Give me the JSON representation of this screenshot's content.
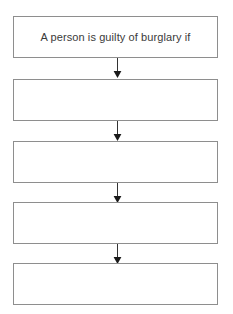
{
  "diagram": {
    "orientation": "vertical-top-down",
    "background_color": "#ffffff",
    "box_border_color": "#8e8e8e",
    "box_fill_color": "#ffffff",
    "text_color": "#3a3a3a",
    "arrow_color": "#333333",
    "nodes": [
      {
        "id": "node-1",
        "label": "A person is guilty of burglary if"
      },
      {
        "id": "node-2",
        "label": ""
      },
      {
        "id": "node-3",
        "label": ""
      },
      {
        "id": "node-4",
        "label": ""
      },
      {
        "id": "node-5",
        "label": ""
      }
    ],
    "connectors": [
      {
        "id": "connector-1",
        "from": "node-1",
        "to": "node-2",
        "kind": "arrow-down"
      },
      {
        "id": "connector-2",
        "from": "node-2",
        "to": "node-3",
        "kind": "arrow-down"
      },
      {
        "id": "connector-3",
        "from": "node-3",
        "to": "node-4",
        "kind": "arrow-down"
      },
      {
        "id": "connector-4",
        "from": "node-4",
        "to": "node-5",
        "kind": "arrow-down"
      }
    ]
  }
}
